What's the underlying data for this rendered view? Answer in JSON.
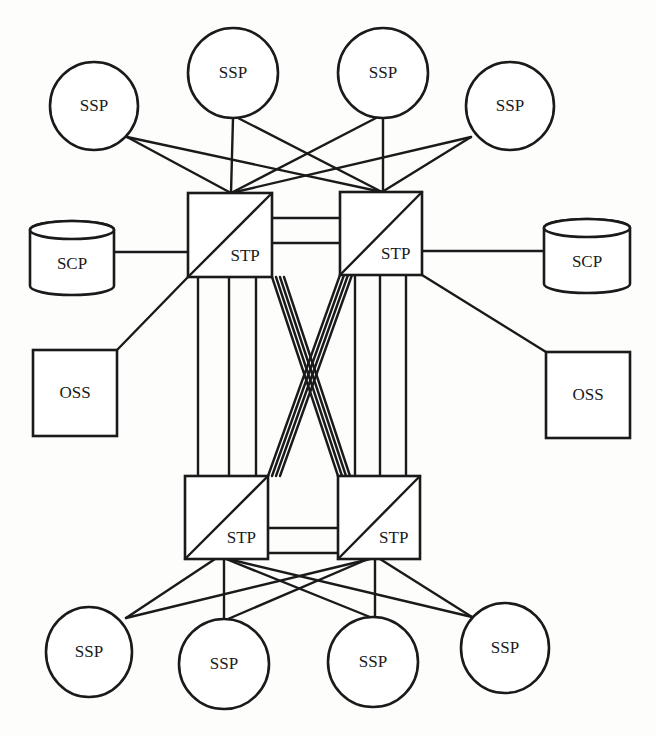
{
  "diagram": {
    "type": "network-topology",
    "colors": {
      "line": "#1a1a1a",
      "fill": "#ffffff",
      "background": "#fdfdfc"
    },
    "stps": [
      {
        "id": "stp-top-left",
        "label": "STP",
        "x": 188,
        "y": 193,
        "w": 84,
        "h": 84
      },
      {
        "id": "stp-top-right",
        "label": "STP",
        "x": 340,
        "y": 192,
        "w": 82,
        "h": 83
      },
      {
        "id": "stp-bottom-left",
        "label": "STP",
        "x": 185,
        "y": 476,
        "w": 83,
        "h": 83
      },
      {
        "id": "stp-bottom-right",
        "label": "STP",
        "x": 338,
        "y": 476,
        "w": 82,
        "h": 83
      }
    ],
    "ssps": [
      {
        "id": "ssp-top-1",
        "label": "SSP",
        "cx": 94,
        "cy": 106,
        "rx": 44,
        "ry": 44
      },
      {
        "id": "ssp-top-2",
        "label": "SSP",
        "cx": 233,
        "cy": 73,
        "rx": 45,
        "ry": 45
      },
      {
        "id": "ssp-top-3",
        "label": "SSP",
        "cx": 383,
        "cy": 73,
        "rx": 45,
        "ry": 45
      },
      {
        "id": "ssp-top-4",
        "label": "SSP",
        "cx": 510,
        "cy": 106,
        "rx": 44,
        "ry": 44
      },
      {
        "id": "ssp-bottom-1",
        "label": "SSP",
        "cx": 89,
        "cy": 652,
        "rx": 43,
        "ry": 45
      },
      {
        "id": "ssp-bottom-2",
        "label": "SSP",
        "cx": 224,
        "cy": 664,
        "rx": 45,
        "ry": 45
      },
      {
        "id": "ssp-bottom-3",
        "label": "SSP",
        "cx": 373,
        "cy": 662,
        "rx": 45,
        "ry": 45
      },
      {
        "id": "ssp-bottom-4",
        "label": "SSP",
        "cx": 505,
        "cy": 648,
        "rx": 44,
        "ry": 45
      }
    ],
    "scps": [
      {
        "id": "scp-left",
        "label": "SCP",
        "x": 30,
        "y": 221,
        "w": 84,
        "h": 74
      },
      {
        "id": "scp-right",
        "label": "SCP",
        "x": 544,
        "y": 219,
        "w": 86,
        "h": 74
      }
    ],
    "osss": [
      {
        "id": "oss-left",
        "label": "OSS",
        "x": 33,
        "y": 350,
        "w": 84,
        "h": 86
      },
      {
        "id": "oss-right",
        "label": "OSS",
        "x": 546,
        "y": 352,
        "w": 84,
        "h": 86
      }
    ],
    "links": [
      [
        127,
        137,
        231,
        193
      ],
      [
        127,
        137,
        382,
        192
      ],
      [
        233,
        118,
        231,
        193
      ],
      [
        238,
        118,
        382,
        192
      ],
      [
        376,
        118,
        231,
        193
      ],
      [
        383,
        118,
        383,
        192
      ],
      [
        471,
        137,
        231,
        193
      ],
      [
        471,
        137,
        382,
        192
      ],
      [
        114,
        252,
        188,
        252
      ],
      [
        422,
        251,
        544,
        251
      ],
      [
        188,
        277,
        117,
        350
      ],
      [
        422,
        275,
        546,
        352
      ],
      [
        272,
        218,
        340,
        218
      ],
      [
        272,
        243,
        340,
        243
      ],
      [
        268,
        528,
        338,
        528
      ],
      [
        268,
        553,
        338,
        553
      ],
      [
        198,
        277,
        198,
        476
      ],
      [
        229,
        277,
        229,
        476
      ],
      [
        256,
        277,
        256,
        476
      ],
      [
        355,
        275,
        355,
        476
      ],
      [
        380,
        275,
        380,
        476
      ],
      [
        406,
        275,
        406,
        476
      ],
      [
        272,
        277,
        338,
        476
      ],
      [
        276,
        277,
        342,
        476
      ],
      [
        280,
        277,
        346,
        476
      ],
      [
        284,
        277,
        350,
        476
      ],
      [
        340,
        275,
        268,
        476
      ],
      [
        344,
        275,
        272,
        476
      ],
      [
        348,
        275,
        276,
        476
      ],
      [
        352,
        275,
        280,
        476
      ],
      [
        215,
        559,
        126,
        618
      ],
      [
        370,
        559,
        126,
        618
      ],
      [
        224,
        559,
        224,
        619
      ],
      [
        368,
        559,
        228,
        619
      ],
      [
        226,
        559,
        370,
        617
      ],
      [
        375,
        559,
        375,
        617
      ],
      [
        228,
        559,
        472,
        617
      ],
      [
        380,
        559,
        472,
        617
      ]
    ]
  }
}
